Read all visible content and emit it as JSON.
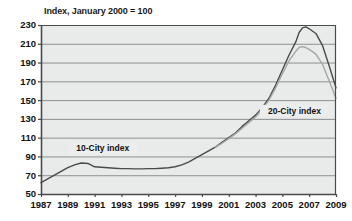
{
  "chart_data": {
    "type": "line",
    "title": "Index, January 2000 = 100",
    "xlabel": "",
    "ylabel": "",
    "xlim": [
      1987,
      2009
    ],
    "ylim": [
      50,
      230
    ],
    "ytick_step": 20,
    "xtick_step": 2,
    "grid": true,
    "legend_position": "inline-annotation",
    "x_ticks": [
      "1987",
      "1989",
      "1991",
      "1993",
      "1995",
      "1997",
      "1999",
      "2001",
      "2003",
      "2005",
      "2007",
      "2009"
    ],
    "y_ticks": [
      "230",
      "210",
      "190",
      "170",
      "150",
      "130",
      "110",
      "90",
      "70",
      "50"
    ],
    "annotations": [
      {
        "text": "10-City index",
        "x": 1991.6,
        "y": 97
      },
      {
        "text": "20-City index",
        "x": 2005.9,
        "y": 137
      }
    ],
    "series": [
      {
        "name": "10-City index",
        "color": "#4a4a4a",
        "x": [
          1987.0,
          1987.5,
          1988.0,
          1988.5,
          1989.0,
          1989.5,
          1990.0,
          1990.5,
          1991.0,
          1991.5,
          1992.0,
          1992.5,
          1993.0,
          1993.5,
          1994.0,
          1994.5,
          1995.0,
          1995.5,
          1996.0,
          1996.5,
          1997.0,
          1997.5,
          1998.0,
          1998.5,
          1999.0,
          1999.5,
          2000.0,
          2000.5,
          2001.0,
          2001.5,
          2002.0,
          2002.5,
          2003.0,
          2003.5,
          2004.0,
          2004.5,
          2005.0,
          2005.5,
          2006.0,
          2006.25,
          2006.5,
          2006.75,
          2007.0,
          2007.5,
          2008.0,
          2008.5,
          2009.0
        ],
        "y": [
          62,
          66,
          70,
          74,
          78,
          81,
          83,
          82.5,
          79,
          78.5,
          78,
          77.5,
          77,
          77,
          76.8,
          76.8,
          77,
          77,
          77.5,
          78,
          79,
          81,
          84,
          88,
          92,
          96,
          100,
          105,
          110,
          115,
          122,
          128,
          134,
          142,
          152,
          166,
          182,
          198,
          212,
          222,
          227,
          228,
          226,
          221,
          208,
          186,
          163
        ]
      },
      {
        "name": "20-City index",
        "color": "#a6a6a6",
        "x": [
          2000.0,
          2000.5,
          2001.0,
          2001.5,
          2002.0,
          2002.5,
          2003.0,
          2003.5,
          2004.0,
          2004.5,
          2005.0,
          2005.5,
          2006.0,
          2006.25,
          2006.5,
          2006.75,
          2007.0,
          2007.5,
          2008.0,
          2008.5,
          2009.0
        ],
        "y": [
          100,
          104,
          109,
          114,
          120,
          126,
          132,
          140,
          150,
          163,
          178,
          192,
          202,
          206,
          207,
          206,
          204,
          199,
          188,
          170,
          152
        ]
      }
    ]
  },
  "plot_geometry": {
    "left": 41,
    "right": 336,
    "top": 25,
    "bottom": 194
  },
  "colors": {
    "plot_background": "#e9eaea",
    "gridline": "#8d8f91",
    "axis": "#4a4a4a",
    "text": "#111111"
  }
}
